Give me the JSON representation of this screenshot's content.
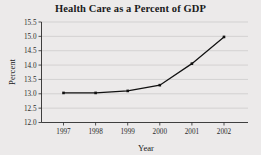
{
  "chart_data": {
    "type": "line",
    "title": "Health Care as a Percent of GDP",
    "xlabel": "Year",
    "ylabel": "Percent",
    "categories": [
      "1997",
      "1998",
      "1999",
      "2000",
      "2001",
      "2002"
    ],
    "x": [
      1997,
      1998,
      1999,
      2000,
      2001,
      2002
    ],
    "values": [
      13.03,
      13.03,
      13.1,
      13.3,
      14.05,
      14.98
    ],
    "series": [
      {
        "name": "Health care percent of GDP",
        "values": [
          13.03,
          13.03,
          13.1,
          13.3,
          14.05,
          14.98
        ]
      }
    ],
    "ylim": [
      12.0,
      15.5
    ],
    "yticks": [
      "12.0",
      "12.5",
      "13.0",
      "13.5",
      "14.0",
      "14.5",
      "15.0",
      "15.5"
    ],
    "ytick_values": [
      12.0,
      12.5,
      13.0,
      13.5,
      14.0,
      14.5,
      15.0,
      15.5
    ],
    "xticks": [
      "1997",
      "1998",
      "1999",
      "2000",
      "2001",
      "2002"
    ],
    "grid": "horizontal",
    "legend": "none",
    "marker": "square",
    "line_color": "#111111",
    "marker_color": "#111111",
    "grid_color": "#c9c7c7",
    "plot_background": "#eceaea",
    "axis_color": "#2b2b2b"
  }
}
